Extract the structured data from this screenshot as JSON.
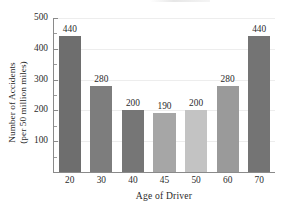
{
  "chart_data": {
    "type": "bar",
    "title": "",
    "xlabel": "Age of Driver",
    "ylabel_line1": "Number of Accidents",
    "ylabel_line2": "(per 50 million miles)",
    "categories": [
      "20",
      "30",
      "40",
      "45",
      "50",
      "60",
      "70"
    ],
    "values": [
      440,
      280,
      200,
      190,
      200,
      280,
      440
    ],
    "value_labels": [
      "440",
      "280",
      "200",
      "190",
      "200",
      "280",
      "440"
    ],
    "bar_colors": [
      "#6e6e6e",
      "#7d7d7d",
      "#767676",
      "#a6a6a6",
      "#c3c3c3",
      "#9a9a9a",
      "#747474"
    ],
    "ylim": [
      0,
      500
    ],
    "ytick_labels": [
      "100",
      "200",
      "300",
      "400",
      "500"
    ],
    "ytick_values": [
      100,
      200,
      300,
      400,
      500
    ],
    "yminor_values": [
      50,
      150,
      250,
      350,
      450
    ],
    "grid": true,
    "grid_color": "#ededed",
    "legend": "none",
    "axis_color": "#8a8a8a",
    "background": "#ffffff"
  }
}
